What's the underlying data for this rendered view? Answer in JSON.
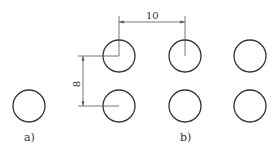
{
  "diagram": {
    "figure_a": {
      "label": "a)",
      "circles": [
        {
          "cx": 29,
          "cy": 106,
          "r": 16
        }
      ]
    },
    "figure_b": {
      "label": "b)",
      "columns_x": [
        119,
        185,
        250
      ],
      "rows_y": [
        56,
        106
      ],
      "radius": 16
    },
    "dimensions": {
      "horizontal": {
        "value": "10",
        "from": "column 1",
        "to": "column 2"
      },
      "vertical": {
        "value": "8",
        "from": "row 1",
        "to": "row 2"
      }
    },
    "colors": {
      "stroke": "#333333",
      "dim_line": "#555555",
      "background": "#ffffff"
    }
  }
}
